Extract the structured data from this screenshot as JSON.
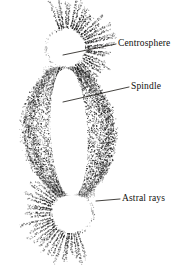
{
  "figure": {
    "background_color": "#ffffff",
    "ink_color": "#1a1a1a",
    "labels": [
      {
        "id": "centrosphere",
        "text": "Centrosphere",
        "text_x": 118,
        "text_y": 46,
        "leader": {
          "x1": 116,
          "y1": 44,
          "x2": 63,
          "y2": 55
        }
      },
      {
        "id": "spindle",
        "text": "Spindle",
        "text_x": 131,
        "text_y": 89,
        "leader": {
          "x1": 129,
          "y1": 87,
          "x2": 63,
          "y2": 102
        }
      },
      {
        "id": "astral-rays",
        "text": "Astral rays",
        "text_x": 122,
        "text_y": 201,
        "leader": {
          "x1": 120,
          "y1": 199,
          "x2": 96,
          "y2": 201
        }
      }
    ],
    "structures": {
      "upper_aster": {
        "name": "upper-aster",
        "center_x": 66,
        "center_y": 48,
        "centrosphere_radius": 20,
        "ray_outer_radius": 48,
        "ray_count": 60
      },
      "lower_aster": {
        "name": "lower-aster",
        "center_x": 72,
        "center_y": 213,
        "centrosphere_radius": 21,
        "ray_outer_radius": 50,
        "ray_count": 60
      },
      "spindle_body": {
        "name": "spindle",
        "top_y": 68,
        "bottom_y": 196,
        "waist_half_width": 46,
        "pole_half_width": 13,
        "clear_zone_half_width": 18,
        "fiber_count": 54
      }
    }
  }
}
